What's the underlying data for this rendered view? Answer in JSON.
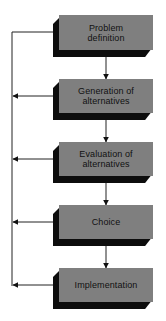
{
  "diagram": {
    "steps": [
      {
        "label_line1": "Problem",
        "label_line2": "definition"
      },
      {
        "label_line1": "Generation of",
        "label_line2": "alternatives"
      },
      {
        "label_line1": "Evaluation of",
        "label_line2": "alternatives"
      },
      {
        "label_line1": "Choice",
        "label_line2": ""
      },
      {
        "label_line1": "Implementation",
        "label_line2": ""
      }
    ],
    "colors": {
      "box_face": "#7f7f7f",
      "box_shadow": "#0d0d0d",
      "connector": "#222222",
      "background": "#ffffff"
    },
    "connections": {
      "forward": [
        "1->2",
        "2->3",
        "3->4",
        "4->5"
      ],
      "feedback": [
        "2->1",
        "3->1",
        "4->1",
        "5->1"
      ]
    }
  }
}
